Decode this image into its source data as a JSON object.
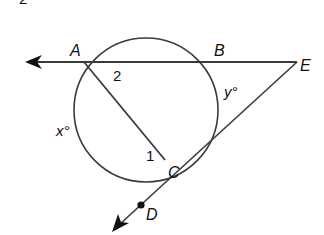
{
  "figure": {
    "type": "geometry",
    "colors": {
      "stroke": "#3a3a3a",
      "text": "#111111",
      "background": "#ffffff"
    },
    "top_fragment": {
      "text": "2",
      "x": 20,
      "y": 4
    },
    "circle": {
      "cx": 146,
      "cy": 110,
      "r": 72
    },
    "points": {
      "A": {
        "label": "A",
        "x": 84,
        "y": 62,
        "lx": 70,
        "ly": 55
      },
      "B": {
        "label": "B",
        "x": 210,
        "y": 62,
        "lx": 215,
        "ly": 55
      },
      "E": {
        "label": "E",
        "x": 297,
        "y": 62,
        "lx": 300,
        "ly": 71
      },
      "C": {
        "label": "C",
        "x": 165,
        "y": 160,
        "lx": 169,
        "ly": 178
      },
      "D": {
        "label": "D",
        "x": 140,
        "y": 205,
        "lx": 146,
        "ly": 222
      }
    },
    "angle_labels": {
      "angle2": {
        "text": "2",
        "x": 113,
        "y": 80
      },
      "angle1": {
        "text": "1",
        "x": 146,
        "y": 160
      }
    },
    "arc_labels": {
      "x": {
        "text": "x°",
        "x": 56,
        "y": 134
      },
      "y": {
        "text": "y°",
        "x": 224,
        "y": 95
      }
    },
    "arrows": {
      "left": {
        "x": 26,
        "y": 62
      },
      "down_left": {
        "x": 114,
        "y": 232
      }
    }
  }
}
